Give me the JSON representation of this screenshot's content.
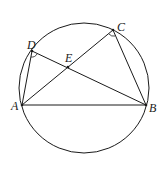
{
  "diagram": {
    "type": "circle-geometry",
    "circle": {
      "cx": 84,
      "cy": 88,
      "r": 65
    },
    "points": {
      "A": {
        "label": "A",
        "x": 22,
        "y": 105
      },
      "B": {
        "label": "B",
        "x": 146,
        "y": 105
      },
      "C": {
        "label": "C",
        "x": 113,
        "y": 30
      },
      "D": {
        "label": "D",
        "x": 32,
        "y": 51
      },
      "E": {
        "label": "E",
        "x": 68,
        "y": 67
      }
    },
    "segments": [
      "AB",
      "AC",
      "BD",
      "AD",
      "BC"
    ],
    "angle_marks": [
      "ADB",
      "ACB"
    ],
    "stroke_color": "#1a1a1a"
  }
}
